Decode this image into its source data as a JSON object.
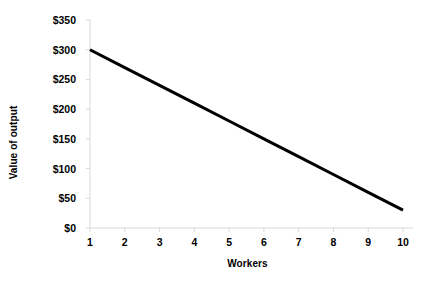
{
  "chart_data": {
    "type": "line",
    "title": "",
    "xlabel": "Workers",
    "ylabel": "Value of output",
    "x": [
      1,
      2,
      3,
      4,
      5,
      6,
      7,
      8,
      9,
      10
    ],
    "series": [
      {
        "name": "Value of output",
        "values": [
          300,
          270,
          240,
          210,
          180,
          150,
          120,
          90,
          60,
          30
        ],
        "color": "#000000",
        "line_width": 3
      }
    ],
    "xlim": [
      1,
      10
    ],
    "ylim": [
      0,
      350
    ],
    "ytick_values": [
      0,
      50,
      100,
      150,
      200,
      250,
      300,
      350
    ],
    "ytick_labels": [
      "$0",
      "$50",
      "$100",
      "$150",
      "$200",
      "$250",
      "$300",
      "$350"
    ],
    "xtick_values": [
      1,
      2,
      3,
      4,
      5,
      6,
      7,
      8,
      9,
      10
    ],
    "xtick_labels": [
      "1",
      "2",
      "3",
      "4",
      "5",
      "6",
      "7",
      "8",
      "9",
      "10"
    ],
    "grid": false,
    "legend": "none",
    "axis_color": "#D9D9D9",
    "background_color": "#FFFFFF",
    "annotations": []
  }
}
